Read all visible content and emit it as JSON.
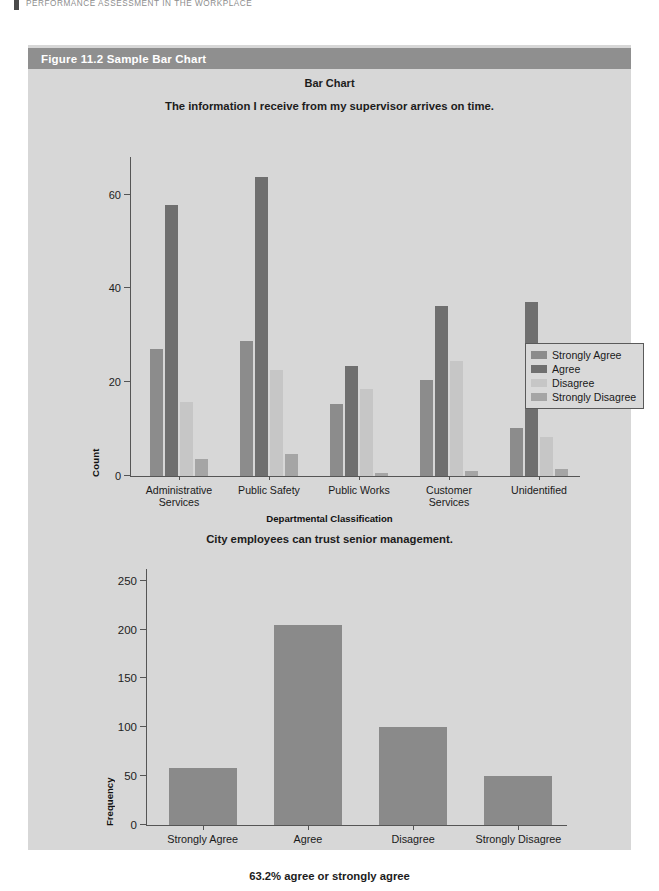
{
  "running_head": {
    "text": "Performance Assessment in the Workplace",
    "rule_icon": "vertical-rule-icon"
  },
  "figure": {
    "caption": "Figure 11.2  Sample Bar Chart",
    "caption_bar_color": "#8f8f8f",
    "panel_color": "#d7d7d7"
  },
  "colors": {
    "strongly_agree": "#8c8c8c",
    "agree": "#6f6f6f",
    "disagree": "#c6c6c6",
    "strongly_disagree": "#a5a5a5",
    "single_series": "#8a8a8a",
    "axis": "#555555"
  },
  "chart_data": [
    {
      "type": "bar",
      "id": "chart-1",
      "title": "Bar Chart",
      "subtitle": "The information I receive from my supervisor arrives on time.",
      "xlabel": "Departmental Classification",
      "ylabel": "Count",
      "ylim": [
        0,
        68
      ],
      "yticks": [
        0,
        20,
        40,
        60
      ],
      "ytick_labels": [
        "0",
        "20",
        "40",
        "60"
      ],
      "grid": false,
      "legend_position": "right-inside",
      "categories": [
        "Administrative\nServices",
        "Public Safety",
        "Public Works",
        "Customer\nServices",
        "Unidentified"
      ],
      "series": [
        {
          "name": "Strongly Agree",
          "color": "#8c8c8c",
          "values": [
            27,
            28.8,
            15.3,
            20.5,
            10.3
          ]
        },
        {
          "name": "Agree",
          "color": "#6f6f6f",
          "values": [
            57.8,
            63.8,
            23.5,
            36.3,
            37.2
          ]
        },
        {
          "name": "Disagree",
          "color": "#c6c6c6",
          "values": [
            15.7,
            22.7,
            18.5,
            24.5,
            8.3
          ]
        },
        {
          "name": "Strongly Disagree",
          "color": "#a5a5a5",
          "values": [
            3.7,
            4.6,
            0.7,
            1.0,
            1.6
          ]
        }
      ]
    },
    {
      "type": "bar",
      "id": "chart-2",
      "title": "City employees can trust senior management.",
      "footer": "63.2% agree or strongly agree",
      "xlabel": "",
      "ylabel": "Frequency",
      "ylim": [
        0,
        262
      ],
      "yticks": [
        0,
        50,
        100,
        150,
        200,
        250
      ],
      "ytick_labels": [
        "0",
        "50",
        "100",
        "150",
        "200",
        "250"
      ],
      "grid": false,
      "categories": [
        "Strongly Agree",
        "Agree",
        "Disagree",
        "Strongly Disagree"
      ],
      "values": [
        58,
        205,
        100,
        50
      ],
      "bar_color": "#8a8a8a"
    }
  ]
}
